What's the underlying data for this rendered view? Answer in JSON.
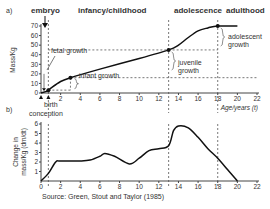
{
  "figure": {
    "panel_a_label": "a)",
    "panel_b_label": "b)",
    "stages": [
      "embryo",
      "infancy/childhood",
      "adolescence",
      "adulthood"
    ],
    "source": "Source: Green, Stout and Taylor (1985)"
  },
  "chart_data": [
    {
      "type": "line",
      "panel": "a",
      "title": "",
      "xlabel": "Age/years (t)",
      "ylabel": "Mass/Kg",
      "xlim": [
        0,
        22
      ],
      "ylim": [
        0,
        70
      ],
      "xticks": [
        2,
        4,
        6,
        8,
        10,
        12,
        14,
        16,
        18,
        20,
        22
      ],
      "yticks": [
        0,
        10,
        20,
        30,
        40,
        50,
        60,
        70
      ],
      "x": [
        0,
        0.75,
        1,
        2,
        3,
        6,
        10,
        13,
        14,
        15,
        16,
        17,
        18,
        20
      ],
      "values": [
        0,
        2.5,
        5,
        12,
        16,
        25,
        36,
        45,
        50,
        58,
        65,
        68,
        70,
        70
      ],
      "points": [
        {
          "x": 0.75,
          "y": 3
        },
        {
          "x": 3,
          "y": 16
        },
        {
          "x": 13,
          "y": 45
        },
        {
          "x": 18,
          "y": 70
        }
      ],
      "annotations": [
        "fetal growth",
        "infant growth",
        "juvenile growth",
        "adolescent growth",
        "birth",
        "conception"
      ],
      "vlines": [
        0.75,
        13,
        18
      ]
    },
    {
      "type": "line",
      "panel": "b",
      "title": "",
      "xlabel": "",
      "ylabel": "Change in mass/Kg (dm/dt)",
      "xlim": [
        0,
        22
      ],
      "ylim": [
        0,
        6
      ],
      "xticks": [
        0,
        2,
        4,
        6,
        8,
        10,
        12,
        14,
        16,
        18,
        20,
        22
      ],
      "yticks": [
        1,
        2,
        3,
        4,
        5,
        6
      ],
      "x": [
        0,
        0.75,
        1.5,
        2,
        4,
        5,
        6,
        6.5,
        7.5,
        9,
        10,
        11,
        12,
        13,
        13.5,
        14,
        15,
        16,
        17,
        18,
        19,
        20
      ],
      "values": [
        0,
        0.8,
        2.0,
        2.1,
        2.1,
        2.2,
        2.6,
        2.9,
        2.6,
        1.8,
        2.4,
        3.2,
        3.4,
        3.7,
        5.3,
        5.8,
        5.6,
        4.6,
        3.4,
        2.4,
        1.2,
        0
      ],
      "vlines": [
        0.75,
        13,
        18
      ]
    }
  ]
}
